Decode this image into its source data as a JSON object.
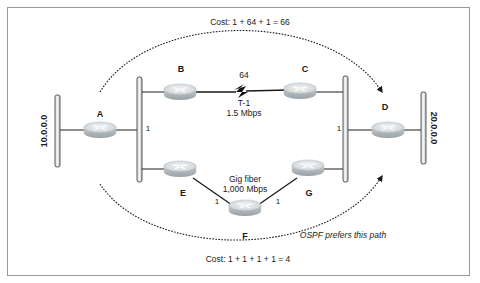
{
  "diagram": {
    "top_path_cost": "Cost: 1 + 64 + 1 = 66",
    "bottom_path_cost": "Cost: 1 + 1 + 1 + 1 = 4",
    "preference_note": "OSPF prefers this path",
    "networks": {
      "left": "10.0.0.0",
      "right": "20.0.0.0"
    },
    "routers": {
      "A": "A",
      "B": "B",
      "C": "C",
      "D": "D",
      "E": "E",
      "F": "F",
      "G": "G"
    },
    "links": {
      "t1_cost": "64",
      "t1_name": "T-1",
      "t1_speed": "1.5 Mbps",
      "gig_name": "Gig fiber",
      "gig_speed": "1,000 Mbps",
      "ef_cost": "1",
      "fg_cost": "1",
      "a_segment_cost": "1",
      "d_segment_cost": "1"
    }
  }
}
